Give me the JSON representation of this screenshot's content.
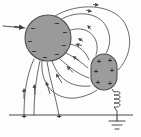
{
  "figure": {
    "type": "physics-field-diagram",
    "background_color": "#fdfdfd",
    "stroke_color": "#4a4a4a",
    "fill_color": "#9a9a9a",
    "fill_color_secondary": "#9c9c9c"
  },
  "objects": {
    "sphere": {
      "name": "charged-sphere",
      "shape": "circle",
      "cx": 48,
      "cy": 38,
      "r": 23,
      "fill": "#9a9a9a",
      "charge_sign": "−",
      "charge_count": 8
    },
    "capsule": {
      "name": "charged-capsule-body",
      "shape": "stadium",
      "x": 91,
      "y": 54,
      "width": 26,
      "height": 36,
      "rx": 13,
      "fill": "#9c9c9c",
      "charge_sign": "+",
      "charge_count": 6
    },
    "ground_line": {
      "name": "ground-plane-line",
      "x1": 9,
      "x2": 133,
      "y": 115,
      "charge_sign": "+",
      "charge_count": 2,
      "charge_positions": [
        24,
        59
      ]
    },
    "inductor": {
      "name": "inductor-coil",
      "x": 115,
      "y_top": 90,
      "y_bottom": 112,
      "loops": 4
    },
    "ground_symbol": {
      "name": "earth-ground-symbol",
      "x": 117,
      "y": 115,
      "bars": 3
    },
    "incoming_arrow": {
      "name": "incoming-field-arrow",
      "x_start": 3,
      "x_end": 26,
      "y": 26
    }
  },
  "field_lines": {
    "label": "electric field lines",
    "count": 11,
    "arrow_direction": "toward negative sphere"
  },
  "signs": {
    "minus": "−",
    "plus": "+"
  }
}
